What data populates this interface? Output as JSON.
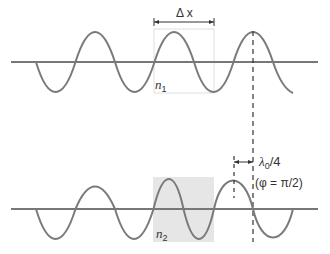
{
  "figure": {
    "top_panel": {
      "medium_label": "n",
      "medium_subscript": "1",
      "distance_label": "Δ x"
    },
    "bottom_panel": {
      "medium_label": "n",
      "medium_subscript": "2",
      "shift_label": "λ",
      "shift_label_sub": "0",
      "shift_label_tail": "/4",
      "phase_label": "(φ = π/2)"
    },
    "colors": {
      "wave": "#7a7a7a",
      "axis": "#777777",
      "shaded_region": "#e6e6e6",
      "box_outline": "#d8d8d8",
      "text": "#333333"
    }
  }
}
